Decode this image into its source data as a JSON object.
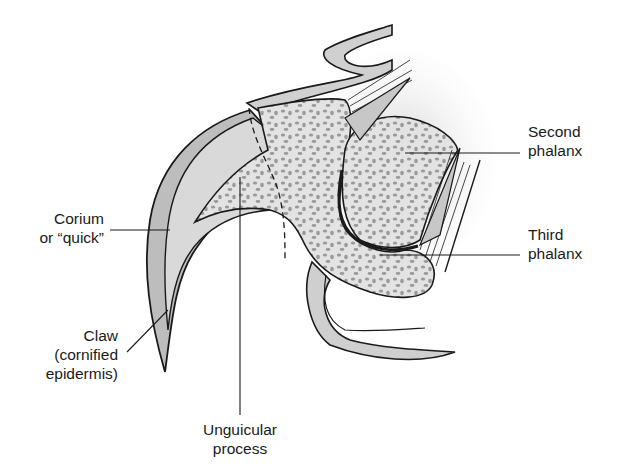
{
  "figure": {
    "colors": {
      "outline": "#1a1a1a",
      "claw_fill": "#bdbdbd",
      "corium_fill": "#d9d9d9",
      "bone_fill": "#e3e3e3",
      "bone_speckle": "#9a9a9a",
      "skin_fill": "#cfcfcf",
      "background": "#ffffff"
    }
  },
  "labels": {
    "second_phalanx": {
      "line1": "Second",
      "line2": "phalanx"
    },
    "third_phalanx": {
      "line1": "Third",
      "line2": "phalanx"
    },
    "corium": {
      "line1": "Corium",
      "line2": "or “quick”"
    },
    "claw": {
      "line1": "Claw",
      "line2": "(cornified",
      "line3": "epidermis)"
    },
    "unguicular": {
      "line1": "Unguicular",
      "line2": "process"
    }
  }
}
